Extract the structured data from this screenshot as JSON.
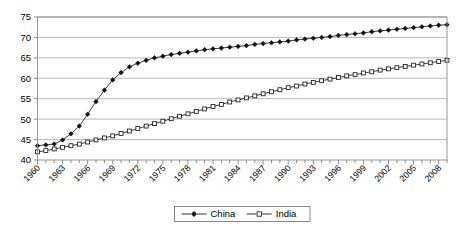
{
  "chart_data": {
    "type": "line",
    "title": "",
    "subtitle": "",
    "xlabel": "",
    "ylabel": "",
    "xlim": [
      1960,
      2009
    ],
    "ylim": [
      40,
      75
    ],
    "ytick_labels": [
      "40",
      "45",
      "50",
      "55",
      "60",
      "65",
      "70",
      "75"
    ],
    "ytick_values": [
      40,
      45,
      50,
      55,
      60,
      65,
      70,
      75
    ],
    "grid": true,
    "legend_position": "bottom-center",
    "x": [
      1960,
      1961,
      1962,
      1963,
      1964,
      1965,
      1966,
      1967,
      1968,
      1969,
      1970,
      1971,
      1972,
      1973,
      1974,
      1975,
      1976,
      1977,
      1978,
      1979,
      1980,
      1981,
      1982,
      1983,
      1984,
      1985,
      1986,
      1987,
      1988,
      1989,
      1990,
      1991,
      1992,
      1993,
      1994,
      1995,
      1996,
      1997,
      1998,
      1999,
      2000,
      2001,
      2002,
      2003,
      2004,
      2005,
      2006,
      2007,
      2008,
      2009
    ],
    "xtick_labels": [
      "1960",
      "1963",
      "1966",
      "1969",
      "1972",
      "1975",
      "1978",
      "1981",
      "1984",
      "1987",
      "1990",
      "1993",
      "1996",
      "1999",
      "2002",
      "2005",
      "2008"
    ],
    "xtick_label_values": [
      1960,
      1963,
      1966,
      1969,
      1972,
      1975,
      1978,
      1981,
      1984,
      1987,
      1990,
      1993,
      1996,
      1999,
      2002,
      2005,
      2008
    ],
    "series": [
      {
        "name": "China",
        "marker": "filled-diamond",
        "values": [
          43.5,
          43.7,
          43.9,
          44.9,
          46.4,
          48.3,
          51.2,
          54.3,
          57.1,
          59.6,
          61.4,
          62.8,
          63.7,
          64.4,
          65.0,
          65.4,
          65.8,
          66.1,
          66.4,
          66.7,
          67.0,
          67.2,
          67.4,
          67.6,
          67.8,
          68.0,
          68.3,
          68.5,
          68.7,
          68.9,
          69.1,
          69.4,
          69.6,
          69.8,
          70.0,
          70.2,
          70.5,
          70.7,
          70.9,
          71.1,
          71.4,
          71.6,
          71.8,
          72.0,
          72.2,
          72.4,
          72.6,
          72.8,
          73.0,
          73.1
        ]
      },
      {
        "name": "India",
        "marker": "open-square",
        "values": [
          42.0,
          42.3,
          42.7,
          43.1,
          43.5,
          43.9,
          44.4,
          44.9,
          45.4,
          45.9,
          46.5,
          47.1,
          47.7,
          48.3,
          48.9,
          49.5,
          50.1,
          50.7,
          51.3,
          51.9,
          52.5,
          53.1,
          53.6,
          54.2,
          54.7,
          55.2,
          55.7,
          56.2,
          56.7,
          57.2,
          57.7,
          58.1,
          58.6,
          59.0,
          59.4,
          59.8,
          60.2,
          60.6,
          60.9,
          61.3,
          61.6,
          62.0,
          62.3,
          62.6,
          62.9,
          63.2,
          63.5,
          63.8,
          64.1,
          64.4
        ]
      }
    ]
  },
  "legend": {
    "entries": [
      {
        "label": "China"
      },
      {
        "label": "India"
      }
    ]
  }
}
